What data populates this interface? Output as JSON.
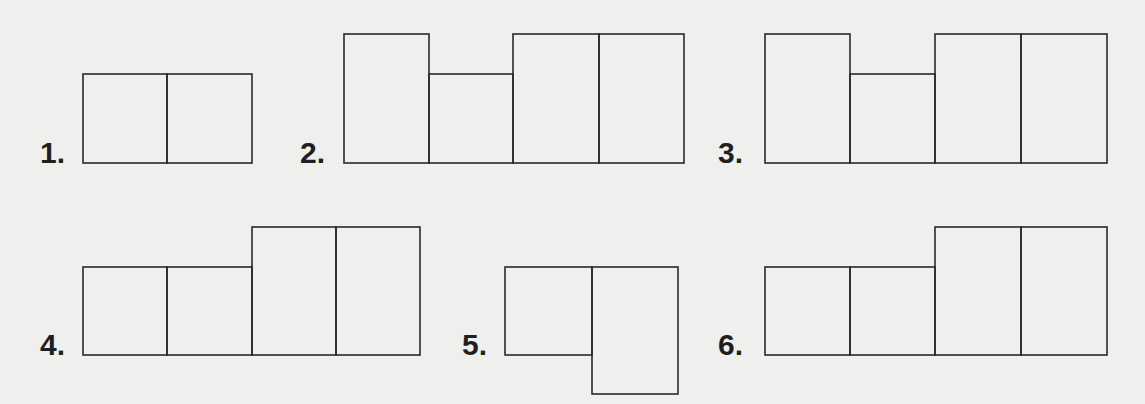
{
  "figures": [
    {
      "label": "1.",
      "label_pos": [
        40,
        138
      ],
      "rects": [
        [
          83,
          74,
          84,
          89
        ],
        [
          167,
          74,
          85,
          89
        ]
      ]
    },
    {
      "label": "2.",
      "label_pos": [
        300,
        138
      ],
      "rects": [
        [
          344,
          34,
          85,
          129
        ],
        [
          429,
          74,
          84,
          89
        ],
        [
          513,
          34,
          86,
          129
        ],
        [
          599,
          34,
          85,
          129
        ]
      ]
    },
    {
      "label": "3.",
      "label_pos": [
        718,
        138
      ],
      "rects": [
        [
          765,
          34,
          85,
          129
        ],
        [
          850,
          74,
          85,
          89
        ],
        [
          935,
          34,
          86,
          129
        ],
        [
          1021,
          34,
          86,
          129
        ]
      ]
    },
    {
      "label": "4.",
      "label_pos": [
        40,
        330
      ],
      "rects": [
        [
          83,
          267,
          84,
          88
        ],
        [
          167,
          267,
          85,
          88
        ],
        [
          252,
          227,
          84,
          128
        ],
        [
          336,
          227,
          84,
          128
        ]
      ]
    },
    {
      "label": "5.",
      "label_pos": [
        462,
        330
      ],
      "rects": [
        [
          505,
          267,
          87,
          88
        ],
        [
          592,
          267,
          86,
          127
        ]
      ]
    },
    {
      "label": "6.",
      "label_pos": [
        718,
        330
      ],
      "rects": [
        [
          765,
          267,
          85,
          88
        ],
        [
          850,
          267,
          85,
          88
        ],
        [
          935,
          227,
          86,
          128
        ],
        [
          1021,
          227,
          86,
          128
        ]
      ]
    }
  ],
  "style": {
    "stroke": "#2a2a2a",
    "background": "#efefed"
  }
}
